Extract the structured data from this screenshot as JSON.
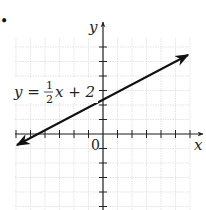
{
  "bullet": "•",
  "chart_data": {
    "type": "line",
    "title": "",
    "equation_label": {
      "lhs": "y =",
      "frac_num": "1",
      "frac_den": "2",
      "rhs": "x + 2"
    },
    "xlabel": "x",
    "ylabel": "y",
    "origin_label": "0",
    "xlim": [
      -6,
      6
    ],
    "ylim": [
      -5,
      6
    ],
    "grid": true,
    "tick_spacing": 1,
    "series": [
      {
        "name": "y = 1/2 x + 2",
        "slope": 0.5,
        "intercept": 2,
        "x": [
          -5.8,
          -4,
          0,
          5.9
        ],
        "y": [
          -0.9,
          0,
          2,
          4.95
        ]
      }
    ],
    "key_points": [
      {
        "label": "y-intercept",
        "x": 0,
        "y": 2
      },
      {
        "label": "x-intercept",
        "x": -4,
        "y": 0
      }
    ]
  },
  "colors": {
    "grid": "#d9d9d9",
    "axis": "#222222",
    "line": "#111111"
  }
}
